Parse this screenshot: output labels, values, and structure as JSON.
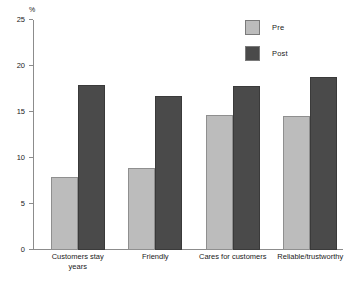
{
  "chart_data": {
    "type": "bar",
    "title": "",
    "subtitle": "",
    "xlabel": "",
    "ylabel": "%",
    "ylim": [
      0,
      25
    ],
    "yticks": [
      0,
      5,
      10,
      15,
      20,
      25
    ],
    "grid": false,
    "legend_position": "top-right",
    "categories": [
      "Customers stay\nyears",
      "Friendly",
      "Cares for customers",
      "Reliable/trustworthy"
    ],
    "series": [
      {
        "name": "Pre",
        "color": "#bcbcbc",
        "values": [
          7.9,
          8.9,
          14.7,
          14.6
        ]
      },
      {
        "name": "Post",
        "color": "#4a4a4a",
        "values": [
          17.9,
          16.7,
          17.8,
          18.8
        ]
      }
    ]
  },
  "axis": {
    "unit_label": "%",
    "tick_labels": [
      "0",
      "5",
      "10",
      "15",
      "20",
      "25"
    ]
  },
  "legend": {
    "entries": [
      {
        "label": "Pre",
        "color": "#bcbcbc"
      },
      {
        "label": "Post",
        "color": "#4a4a4a"
      }
    ]
  }
}
